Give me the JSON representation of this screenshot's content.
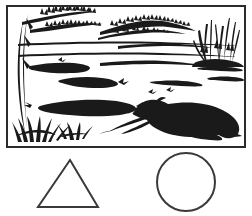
{
  "image": {
    "title": "Riverbank landscape line drawing with geometric shapes",
    "style": "black-and-white pen-and-ink line art",
    "background_color": "#ffffff",
    "ink_color": "#1a1a1a",
    "width": 252,
    "height": 216
  },
  "frame": {
    "name": "picture-frame",
    "border_color": "#2b2b2b",
    "border_width": 2,
    "x": 6,
    "y": 5,
    "width": 240,
    "height": 143
  },
  "scene": {
    "caption": "Lake or riverbank with reeds, water ripples and a resting canine animal",
    "elements": [
      {
        "name": "overhanging-branch",
        "label": "Overhanging tree branch with leaf sprigs",
        "position": "top-left"
      },
      {
        "name": "distant-treeline",
        "label": "Jagged distant treeline on far shore",
        "position": "top-center"
      },
      {
        "name": "reed-clump",
        "label": "Tall reed and grass clumps",
        "position": "top-right"
      },
      {
        "name": "horizon-line",
        "label": "Far shoreline / horizon line",
        "position": "upper-middle"
      },
      {
        "name": "water-ripples",
        "label": "Water ripples and sandbars",
        "position": "middle"
      },
      {
        "name": "shore-grass",
        "label": "Grass tufts on near shore",
        "position": "bottom-left"
      },
      {
        "name": "resting-animal",
        "label": "Reclining canine animal facing left",
        "position": "bottom-right"
      }
    ]
  },
  "shapes": {
    "triangle": {
      "name": "triangle-outline",
      "label": "Triangle",
      "stroke_color": "#3a3a3a",
      "stroke_width": 2,
      "apex_x": 70,
      "apex_y": 160,
      "base_left_x": 38,
      "base_right_x": 98,
      "base_y": 207
    },
    "circle": {
      "name": "circle-outline",
      "label": "Circle",
      "stroke_color": "#3a3a3a",
      "stroke_width": 2,
      "center_x": 186,
      "center_y": 182,
      "radius": 29
    }
  }
}
